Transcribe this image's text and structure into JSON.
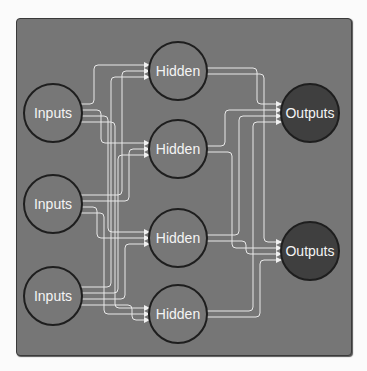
{
  "diagram": {
    "title": "",
    "colors": {
      "background": "#fbfbfb",
      "panel": "#767676",
      "node_fill": "#777777",
      "output_fill": "#3f3f3f",
      "node_stroke": "#1e1e1e",
      "edge": "#e8e8e8",
      "text": "#f4f4f4"
    },
    "nodes": [
      {
        "id": "in1",
        "label": "Inputs",
        "layer": "input",
        "cx": 53,
        "cy": 113
      },
      {
        "id": "in2",
        "label": "Inputs",
        "layer": "input",
        "cx": 53,
        "cy": 204
      },
      {
        "id": "in3",
        "label": "Inputs",
        "layer": "input",
        "cx": 53,
        "cy": 296
      },
      {
        "id": "h1",
        "label": "Hidden",
        "layer": "hidden",
        "cx": 178,
        "cy": 71
      },
      {
        "id": "h2",
        "label": "Hidden",
        "layer": "hidden",
        "cx": 178,
        "cy": 149
      },
      {
        "id": "h3",
        "label": "Hidden",
        "layer": "hidden",
        "cx": 178,
        "cy": 238
      },
      {
        "id": "h4",
        "label": "Hidden",
        "layer": "hidden",
        "cx": 178,
        "cy": 314
      },
      {
        "id": "out1",
        "label": "Outputs",
        "layer": "output",
        "cx": 310,
        "cy": 113
      },
      {
        "id": "out2",
        "label": "Outputs",
        "layer": "output",
        "cx": 310,
        "cy": 251
      }
    ],
    "edges": [
      [
        "in1",
        "h1"
      ],
      [
        "in1",
        "h2"
      ],
      [
        "in1",
        "h3"
      ],
      [
        "in1",
        "h4"
      ],
      [
        "in2",
        "h1"
      ],
      [
        "in2",
        "h2"
      ],
      [
        "in2",
        "h3"
      ],
      [
        "in2",
        "h4"
      ],
      [
        "in3",
        "h1"
      ],
      [
        "in3",
        "h2"
      ],
      [
        "in3",
        "h3"
      ],
      [
        "in3",
        "h4"
      ],
      [
        "h1",
        "out1"
      ],
      [
        "h1",
        "out2"
      ],
      [
        "h2",
        "out1"
      ],
      [
        "h2",
        "out2"
      ],
      [
        "h3",
        "out1"
      ],
      [
        "h3",
        "out2"
      ],
      [
        "h4",
        "out1"
      ],
      [
        "h4",
        "out2"
      ]
    ]
  }
}
